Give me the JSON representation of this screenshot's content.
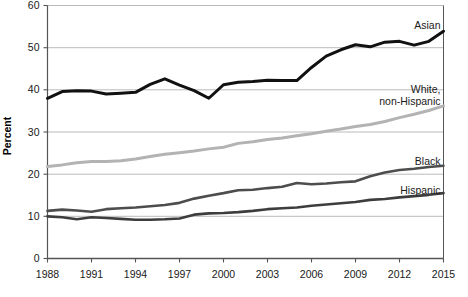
{
  "chart_data": {
    "type": "line",
    "title": "",
    "subtitle": "",
    "xlabel": "",
    "ylabel": "Percent",
    "xlim": [
      1988,
      2015
    ],
    "ylim": [
      0,
      60
    ],
    "grid": true,
    "legend_position": "right-inline",
    "yticks": [
      0,
      10,
      20,
      30,
      40,
      50,
      60
    ],
    "ytick_labels": [
      "0",
      "10",
      "20",
      "30",
      "40",
      "50",
      "60"
    ],
    "xticks": [
      1988,
      1991,
      1994,
      1997,
      2000,
      2003,
      2006,
      2009,
      2012,
      2015
    ],
    "xtick_labels": [
      "1988",
      "1991",
      "1994",
      "1997",
      "2000",
      "2003",
      "2006",
      "2009",
      "2012",
      "2015"
    ],
    "x": [
      1988,
      1989,
      1990,
      1991,
      1992,
      1993,
      1994,
      1995,
      1996,
      1997,
      1998,
      1999,
      2000,
      2001,
      2002,
      2003,
      2004,
      2005,
      2006,
      2007,
      2008,
      2009,
      2010,
      2011,
      2012,
      2013,
      2014,
      2015
    ],
    "series": [
      {
        "name": "Asian",
        "color": "#111111",
        "width": 3.0,
        "label": "Asian",
        "label_value": 53.9,
        "values": [
          38.0,
          39.6,
          39.8,
          39.7,
          39.0,
          39.2,
          39.4,
          41.3,
          42.6,
          41.1,
          39.8,
          38.0,
          41.2,
          41.8,
          42.0,
          42.3,
          42.2,
          42.2,
          45.3,
          48.0,
          49.5,
          50.7,
          50.2,
          51.3,
          51.5,
          50.6,
          51.5,
          53.9
        ]
      },
      {
        "name": "White, non-Hispanic",
        "color": "#b3b3b3",
        "width": 3.0,
        "label": "White,\nnon-Hispanic",
        "label_value": 36.2,
        "values": [
          21.8,
          22.2,
          22.7,
          23.0,
          23.0,
          23.2,
          23.6,
          24.2,
          24.7,
          25.1,
          25.5,
          26.0,
          26.4,
          27.3,
          27.7,
          28.2,
          28.6,
          29.1,
          29.6,
          30.2,
          30.7,
          31.3,
          31.8,
          32.5,
          33.4,
          34.2,
          35.1,
          36.2
        ]
      },
      {
        "name": "Black",
        "color": "#4d4d4d",
        "width": 2.6,
        "label": "Black",
        "label_value": 22.0,
        "values": [
          11.3,
          11.6,
          11.4,
          11.1,
          11.7,
          11.9,
          12.1,
          12.4,
          12.7,
          13.2,
          14.2,
          14.9,
          15.5,
          16.2,
          16.3,
          16.7,
          17.0,
          17.9,
          17.6,
          17.8,
          18.1,
          18.3,
          19.5,
          20.4,
          21.0,
          21.3,
          21.7,
          22.0
        ]
      },
      {
        "name": "Hispanic",
        "color": "#3d3d3d",
        "width": 2.6,
        "label": "Hispanic",
        "label_value": 15.5,
        "values": [
          10.0,
          9.8,
          9.3,
          9.8,
          9.6,
          9.4,
          9.2,
          9.2,
          9.3,
          9.5,
          10.4,
          10.7,
          10.8,
          11.0,
          11.3,
          11.7,
          11.9,
          12.1,
          12.5,
          12.8,
          13.1,
          13.4,
          13.9,
          14.1,
          14.5,
          14.8,
          15.1,
          15.5
        ]
      }
    ]
  },
  "chart_colors": {
    "background": "#ffffff",
    "gridline": "#aaaaaa",
    "axis": "#555555",
    "text": "#1a1a1a"
  }
}
